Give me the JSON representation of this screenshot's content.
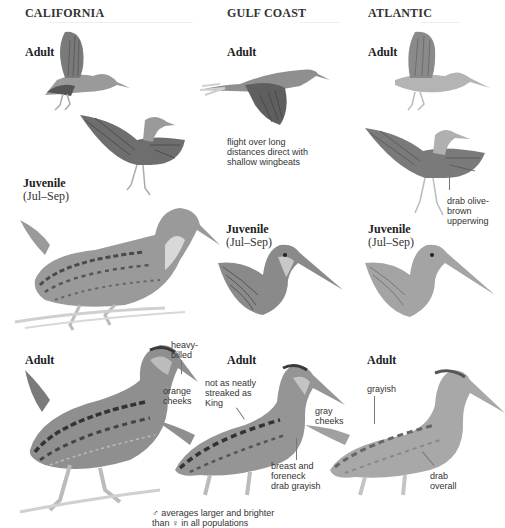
{
  "columns": [
    {
      "title": "CALIFORNIA"
    },
    {
      "title": "GULF COAST"
    },
    {
      "title": "ATLANTIC"
    }
  ],
  "california": {
    "flight_label": "Adult",
    "juvenile_label": "Juvenile",
    "juvenile_sub": "(Jul–Sep)",
    "adult_label": "Adult",
    "notes": {
      "bill": "heavy-\nbilled",
      "cheeks": "orange\ncheeks"
    }
  },
  "gulf": {
    "flight_label": "Adult",
    "flight_note": "flight over long\ndistances direct with\nshallow wingbeats",
    "juvenile_label": "Juvenile",
    "juvenile_sub": "(Jul–Sep)",
    "adult_label": "Adult",
    "notes": {
      "streaks": "not as neatly\nstreaked as\nKing",
      "cheeks": "gray\ncheeks",
      "breast": "breast and\nforeneck\ndrab grayish"
    }
  },
  "atlantic": {
    "flight_label": "Adult",
    "wing_note": "drab olive-\nbrown\nupperwing",
    "juvenile_label": "Juvenile",
    "juvenile_sub": "(Jul–Sep)",
    "adult_label": "Adult",
    "notes": {
      "back": "grayish",
      "overall": "drab\noverall"
    }
  },
  "footnote": "♂ averages larger and brighter\nthan ♀ in all populations",
  "colors": {
    "ink": "#222222",
    "bird_dark": "#5a5a5a",
    "bird_mid": "#8c8c8c",
    "bird_light": "#c4c4c4",
    "rule": "#eeeeee"
  }
}
